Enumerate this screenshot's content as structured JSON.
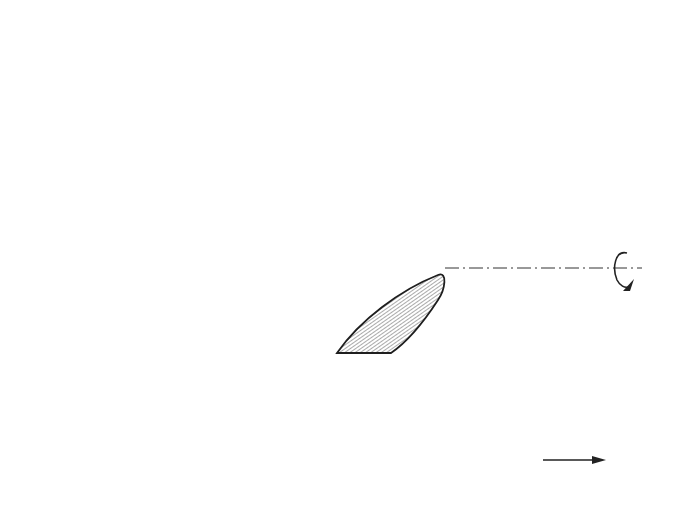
{
  "figure": {
    "burgers_vector_label": "b",
    "rotation_axis_icon": "rotation-arrow-icon",
    "crack_fill": "hatched",
    "line_color": "#2a2a2a",
    "background_color": "#ffffff"
  }
}
